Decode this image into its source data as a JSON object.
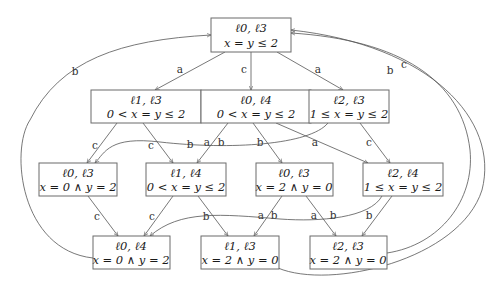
{
  "nodes": [
    {
      "id": "n0",
      "locs": "ℓ0, ℓ3",
      "cond": "x = y ≤ 2"
    },
    {
      "id": "n1",
      "locs": "ℓ1, ℓ3",
      "cond": "0 < x = y ≤ 2"
    },
    {
      "id": "n2",
      "locs": "ℓ0, ℓ4",
      "cond": "0 < x = y ≤ 2"
    },
    {
      "id": "n3",
      "locs": "ℓ2, ℓ3",
      "cond": "1 ≤ x = y ≤ 2"
    },
    {
      "id": "n4",
      "locs": "ℓ0, ℓ3",
      "cond": "x = 0 ∧ y = 2"
    },
    {
      "id": "n5",
      "locs": "ℓ1, ℓ4",
      "cond": "0 < x = y ≤ 2"
    },
    {
      "id": "n6",
      "locs": "ℓ0, ℓ3",
      "cond": "x = 2 ∧ y = 0"
    },
    {
      "id": "n7",
      "locs": "ℓ2, ℓ4",
      "cond": "1 ≤ x = y ≤ 2"
    },
    {
      "id": "n8",
      "locs": "ℓ0, ℓ4",
      "cond": "x = 0 ∧ y = 2"
    },
    {
      "id": "n9",
      "locs": "ℓ1, ℓ3",
      "cond": "x = 2 ∧ y = 0"
    },
    {
      "id": "n10",
      "locs": "ℓ2, ℓ3",
      "cond": "x = 2 ∧ y = 0"
    }
  ],
  "edges": [
    {
      "from": "n0",
      "to": "n1",
      "label": "a"
    },
    {
      "from": "n0",
      "to": "n2",
      "label": "c"
    },
    {
      "from": "n0",
      "to": "n3",
      "label": "a"
    },
    {
      "from": "n1",
      "to": "n4",
      "label": "c"
    },
    {
      "from": "n1",
      "to": "n5",
      "label": "c"
    },
    {
      "from": "n2",
      "to": "n5",
      "label": "a"
    },
    {
      "from": "n2",
      "to": "n5",
      "label": "b"
    },
    {
      "from": "n2",
      "to": "n6",
      "label": "b"
    },
    {
      "from": "n2",
      "to": "n7",
      "label": "a"
    },
    {
      "from": "n3",
      "to": "n4",
      "label": "b"
    },
    {
      "from": "n3",
      "to": "n7",
      "label": "c"
    },
    {
      "from": "n4",
      "to": "n8",
      "label": "c"
    },
    {
      "from": "n5",
      "to": "n8",
      "label": "c"
    },
    {
      "from": "n5",
      "to": "n9",
      "label": "b"
    },
    {
      "from": "n6",
      "to": "n9",
      "label": "a"
    },
    {
      "from": "n6",
      "to": "n9",
      "label": "b"
    },
    {
      "from": "n6",
      "to": "n10",
      "label": "a"
    },
    {
      "from": "n7",
      "to": "n8",
      "label": "b"
    },
    {
      "from": "n7",
      "to": "n10",
      "label": "b"
    },
    {
      "from": "n8",
      "to": "n0",
      "label": "b"
    },
    {
      "from": "n10",
      "to": "n0",
      "label": "b"
    },
    {
      "from": "n9",
      "to": "n0",
      "label": "c"
    }
  ]
}
